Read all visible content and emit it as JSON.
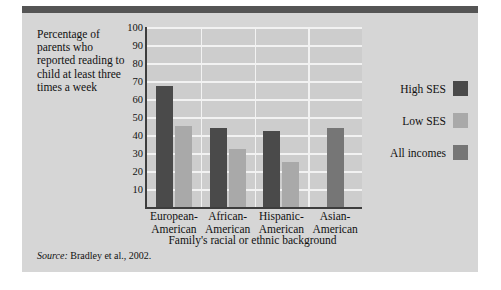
{
  "figure": {
    "caption": "Percentage of parents who reported reading to child at least three times a week",
    "source_word": "Source:",
    "source_text": " Bradley et al., 2002."
  },
  "legend": {
    "items": [
      {
        "label": "High SES",
        "color": "#4a4a4a"
      },
      {
        "label": "Low SES",
        "color": "#a9a9a9"
      },
      {
        "label": "All incomes",
        "color": "#767676"
      }
    ]
  },
  "chart_data": {
    "type": "bar",
    "title": "",
    "xlabel": "Family's racial or ethnic background",
    "ylabel": "Percentage of parents who reported reading to child at least three times a week",
    "ylim": [
      0,
      100
    ],
    "yticks": [
      10,
      20,
      30,
      40,
      50,
      60,
      70,
      80,
      90,
      100
    ],
    "grid": true,
    "legend_position": "right",
    "categories": [
      "European-American",
      "African-American",
      "Hispanic-American",
      "Asian-American"
    ],
    "category_lines": [
      [
        "European-",
        "American"
      ],
      [
        "African-",
        "American"
      ],
      [
        "Hispanic-",
        "American"
      ],
      [
        "Asian-",
        "American"
      ]
    ],
    "series": [
      {
        "name": "High SES",
        "color": "#4a4a4a",
        "values": [
          67,
          44,
          42,
          null
        ]
      },
      {
        "name": "Low SES",
        "color": "#a9a9a9",
        "values": [
          45,
          32,
          25,
          null
        ]
      },
      {
        "name": "All incomes",
        "color": "#767676",
        "values": [
          null,
          null,
          null,
          44
        ]
      }
    ]
  }
}
